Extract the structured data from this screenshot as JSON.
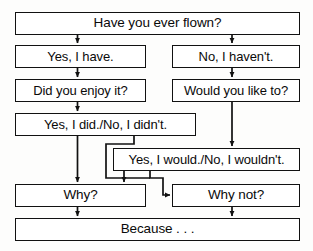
{
  "diagram": {
    "background_color": "#fdfdfc",
    "line_color": "#111111",
    "text_color": "#0a0a0a"
  },
  "nodes": [
    {
      "id": "have-you-ever-flown",
      "text": "Have you ever flown?",
      "x": 15,
      "y": 12,
      "width": 285,
      "height": 23,
      "font_size": 13.5
    },
    {
      "id": "yes-i-have",
      "text": "Yes, I have.",
      "x": 15,
      "y": 45,
      "width": 131,
      "height": 23,
      "font_size": 13
    },
    {
      "id": "no-i-havent",
      "text": "No, I haven't.",
      "x": 172,
      "y": 45,
      "width": 128,
      "height": 23,
      "font_size": 13
    },
    {
      "id": "did-you-enjoy-it",
      "text": "Did you enjoy it?",
      "x": 15,
      "y": 79,
      "width": 131,
      "height": 23,
      "font_size": 13
    },
    {
      "id": "would-you-like-to",
      "text": "Would you like to?",
      "x": 172,
      "y": 79,
      "width": 128,
      "height": 23,
      "font_size": 13
    },
    {
      "id": "yes-i-did-no-i-didnt",
      "text": "Yes, I did./No, I didn't.",
      "x": 15,
      "y": 113,
      "width": 181,
      "height": 23,
      "font_size": 13
    },
    {
      "id": "yes-i-would-no-i-wouldnt",
      "text": "Yes, I would./No, I wouldn't.",
      "x": 113,
      "y": 148,
      "width": 187,
      "height": 23,
      "font_size": 13
    },
    {
      "id": "why",
      "text": "Why?",
      "x": 15,
      "y": 184,
      "width": 131,
      "height": 23,
      "font_size": 13.5
    },
    {
      "id": "why-not",
      "text": "Why not?",
      "x": 172,
      "y": 184,
      "width": 128,
      "height": 23,
      "font_size": 13.5
    },
    {
      "id": "because",
      "text": "Because . . .",
      "x": 15,
      "y": 218,
      "width": 285,
      "height": 23,
      "font_size": 13.5
    }
  ],
  "edges": [
    {
      "id": "flown-to-yes-have",
      "from": "have-you-ever-flown",
      "to": "yes-i-have",
      "path": "M 77.5 35 L 77.5 43",
      "arrow": true
    },
    {
      "id": "flown-to-no-havent",
      "from": "have-you-ever-flown",
      "to": "no-i-havent",
      "path": "M 232 35 L 232 43",
      "arrow": true
    },
    {
      "id": "yes-have-to-enjoy",
      "from": "yes-i-have",
      "to": "did-you-enjoy-it",
      "path": "M 77.5 68 L 77.5 77",
      "arrow": true
    },
    {
      "id": "no-havent-to-would-like",
      "from": "no-i-havent",
      "to": "would-you-like-to",
      "path": "M 232 68 L 232 77",
      "arrow": true
    },
    {
      "id": "enjoy-to-yes-did",
      "from": "did-you-enjoy-it",
      "to": "yes-i-did-no-i-didnt",
      "path": "M 77.5 102 L 77.5 111",
      "arrow": true
    },
    {
      "id": "would-like-to-yes-would",
      "from": "would-you-like-to",
      "to": "yes-i-would-no-i-wouldnt",
      "path": "M 232 102 L 232 146",
      "arrow": true
    },
    {
      "id": "yes-did-to-why",
      "from": "yes-i-did-no-i-didnt",
      "to": "why",
      "path": "M 77.5 136 L 77.5 182",
      "arrow": true
    },
    {
      "id": "yes-did-to-yes-would-elbow",
      "from": "yes-i-did-no-i-didnt",
      "to": "yes-i-would-no-i-wouldnt",
      "path": "M 134 136 L 134 144 L 106 144 L 106 178 L 150 178",
      "arrow": false
    },
    {
      "id": "yes-would-to-why",
      "from": "yes-i-would-no-i-wouldnt",
      "to": "why",
      "path": "M 124 171 L 124 182",
      "arrow": true
    },
    {
      "id": "yes-would-to-why-not-elbow",
      "from": "yes-i-would-no-i-wouldnt",
      "to": "why-not",
      "path": "M 150 171 L 150 178 L 163 178 L 163 195 L 170 195",
      "arrow": true
    },
    {
      "id": "why-to-because",
      "from": "why",
      "to": "because",
      "path": "M 77.5 207 L 77.5 216",
      "arrow": true
    },
    {
      "id": "why-not-to-because",
      "from": "why-not",
      "to": "because",
      "path": "M 232 207 L 232 216",
      "arrow": true
    }
  ]
}
